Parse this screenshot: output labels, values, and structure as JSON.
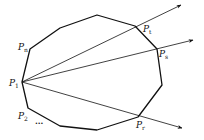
{
  "diagram": {
    "type": "convex-polygon-with-rays",
    "stroke_color": "#111111",
    "background": "#ffffff",
    "polygon": {
      "vertices": [
        {
          "x": 22,
          "y": 82
        },
        {
          "x": 28,
          "y": 108
        },
        {
          "x": 60,
          "y": 126
        },
        {
          "x": 97,
          "y": 130
        },
        {
          "x": 138,
          "y": 117
        },
        {
          "x": 162,
          "y": 85
        },
        {
          "x": 157,
          "y": 49
        },
        {
          "x": 135,
          "y": 26
        },
        {
          "x": 97,
          "y": 15
        },
        {
          "x": 60,
          "y": 28
        },
        {
          "x": 30,
          "y": 49
        }
      ]
    },
    "rays": [
      {
        "from": "P1",
        "to_label": "Pt",
        "x2": 181,
        "y2": 5
      },
      {
        "from": "P1",
        "to_label": "Ps",
        "x2": 193,
        "y2": 40
      },
      {
        "from": "P1",
        "to_label": "Pr",
        "x2": 182,
        "y2": 128
      }
    ],
    "labels": {
      "p1": {
        "base": "P",
        "sub": "1"
      },
      "p2": {
        "base": "P",
        "sub": "2"
      },
      "pn": {
        "base": "P",
        "sub": "n"
      },
      "pt": {
        "base": "P",
        "sub": "t"
      },
      "ps": {
        "base": "P",
        "sub": "s"
      },
      "pr": {
        "base": "P",
        "sub": "r"
      },
      "ellipsis": "..."
    }
  }
}
